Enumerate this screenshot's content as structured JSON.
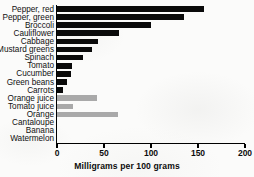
{
  "chart_data": {
    "type": "bar",
    "orientation": "horizontal",
    "title": "",
    "xlabel": "Milligrams per 100 grams",
    "ylabel": "",
    "xlim": [
      0,
      200
    ],
    "xticks": [
      0,
      50,
      100,
      150,
      200
    ],
    "xtick_labels": [
      "0",
      "50",
      "100",
      "150",
      "200"
    ],
    "grid": false,
    "legend": "none",
    "categories": [
      "Pepper, red",
      "Pepper, green",
      "Broccoli",
      "Cauliflower",
      "Cabbage",
      "Mustard greens",
      "Spinach",
      "Tomato",
      "Cucumber",
      "Green beans",
      "Carrots",
      "Orange juice",
      "Tomato juice",
      "Orange",
      "Cantaloupe",
      "Banana",
      "Watermelon"
    ],
    "values": [
      156,
      135,
      100,
      66,
      44,
      37,
      28,
      16,
      15,
      11,
      6,
      43,
      17,
      65,
      0,
      0,
      0
    ],
    "bar_colors": [
      "#0a0a0a",
      "#0a0a0a",
      "#0a0a0a",
      "#0a0a0a",
      "#0a0a0a",
      "#0a0a0a",
      "#0a0a0a",
      "#0a0a0a",
      "#0a0a0a",
      "#0a0a0a",
      "#0a0a0a",
      "#a9a9a9",
      "#a9a9a9",
      "#a9a9a9",
      "#a9a9a9",
      "#a9a9a9",
      "#a9a9a9"
    ],
    "colors": {
      "vegetables": "#0a0a0a",
      "fruits_and_juices": "#a9a9a9",
      "axis": "#000000",
      "background": "#fbfbfa"
    }
  }
}
